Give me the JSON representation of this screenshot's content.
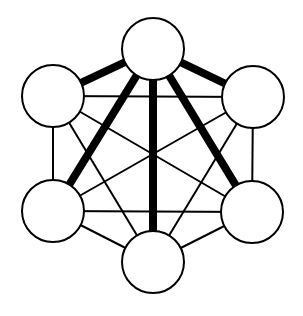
{
  "diagram": {
    "type": "graph",
    "colors": {
      "background": "#ffffff",
      "stroke": "#000000",
      "node_fill": "#ffffff"
    },
    "node_radius": 31,
    "nodes": [
      {
        "id": "top",
        "x": 153,
        "y": 49
      },
      {
        "id": "left-upper",
        "x": 53,
        "y": 96
      },
      {
        "id": "right-upper",
        "x": 253,
        "y": 97
      },
      {
        "id": "left-lower",
        "x": 53,
        "y": 211
      },
      {
        "id": "right-lower",
        "x": 252,
        "y": 212
      },
      {
        "id": "bottom",
        "x": 153,
        "y": 262
      }
    ],
    "edges": [
      {
        "from": "top",
        "to": "left-upper",
        "weight": "thick"
      },
      {
        "from": "top",
        "to": "right-upper",
        "weight": "thick"
      },
      {
        "from": "top",
        "to": "left-lower",
        "weight": "thick"
      },
      {
        "from": "top",
        "to": "right-lower",
        "weight": "thick"
      },
      {
        "from": "top",
        "to": "bottom",
        "weight": "thick"
      },
      {
        "from": "left-upper",
        "to": "right-upper",
        "weight": "thin"
      },
      {
        "from": "left-upper",
        "to": "left-lower",
        "weight": "thin"
      },
      {
        "from": "left-upper",
        "to": "right-lower",
        "weight": "thin"
      },
      {
        "from": "left-upper",
        "to": "bottom",
        "weight": "thin"
      },
      {
        "from": "right-upper",
        "to": "left-lower",
        "weight": "thin"
      },
      {
        "from": "right-upper",
        "to": "right-lower",
        "weight": "thin"
      },
      {
        "from": "right-upper",
        "to": "bottom",
        "weight": "thin"
      },
      {
        "from": "left-lower",
        "to": "right-lower",
        "weight": "thin"
      },
      {
        "from": "left-lower",
        "to": "bottom",
        "weight": "thin"
      },
      {
        "from": "right-lower",
        "to": "bottom",
        "weight": "thin"
      }
    ],
    "stroke_widths": {
      "thick": 8,
      "thin": 2,
      "node": 2
    }
  }
}
